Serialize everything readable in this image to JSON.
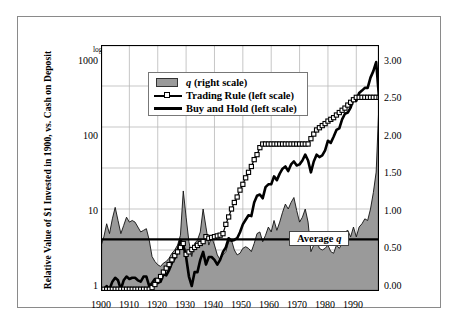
{
  "chart_data": {
    "type": "line",
    "title": "",
    "subtitle": "",
    "ylabel": "Relative Value of $1 Invested in 1900, vs. Cash on Deposit",
    "xlabel": "",
    "y_scale_note": "log scale",
    "yscale": "log",
    "ylim": [
      1,
      1000
    ],
    "yticks": [
      "1",
      "10",
      "100",
      "1000"
    ],
    "y2lim": [
      0.0,
      3.0
    ],
    "y2ticks": [
      "0.00",
      "0.50",
      "1.00",
      "1.50",
      "2.00",
      "2.50",
      "3.00"
    ],
    "xlim": [
      1900,
      1998
    ],
    "xticks": [
      "1900",
      "1910",
      "1920",
      "1930",
      "1940",
      "1950",
      "1960",
      "1970",
      "1980",
      "1990"
    ],
    "grid": true,
    "legend_position": "top-left-inside",
    "legend": [
      {
        "label": "q (right scale)",
        "marker": "filled-area",
        "color": "#9a9a9a",
        "italic_token": "q"
      },
      {
        "label": "Trading Rule (left scale)",
        "marker": "line-open-square",
        "color": "#000000"
      },
      {
        "label": "Buy and Hold (left scale)",
        "marker": "thick-line",
        "color": "#000000"
      }
    ],
    "annotations": [
      {
        "text": "Average q",
        "kind": "horizontal-reference-line",
        "y2_value": 0.63,
        "italic_token": "q"
      }
    ],
    "series": [
      {
        "name": "q (right scale)",
        "axis": "right",
        "type": "area",
        "color": "#9a9a9a",
        "x": [
          1900,
          1901,
          1902,
          1903,
          1904,
          1905,
          1906,
          1907,
          1908,
          1909,
          1910,
          1911,
          1912,
          1913,
          1914,
          1915,
          1916,
          1917,
          1918,
          1919,
          1920,
          1921,
          1922,
          1923,
          1924,
          1925,
          1926,
          1927,
          1928,
          1929,
          1930,
          1931,
          1932,
          1933,
          1934,
          1935,
          1936,
          1937,
          1938,
          1939,
          1940,
          1941,
          1942,
          1943,
          1944,
          1945,
          1946,
          1947,
          1948,
          1949,
          1950,
          1951,
          1952,
          1953,
          1954,
          1955,
          1956,
          1957,
          1958,
          1959,
          1960,
          1961,
          1962,
          1963,
          1964,
          1965,
          1966,
          1967,
          1968,
          1969,
          1970,
          1971,
          1972,
          1973,
          1974,
          1975,
          1976,
          1977,
          1978,
          1979,
          1980,
          1981,
          1982,
          1983,
          1984,
          1985,
          1986,
          1987,
          1988,
          1989,
          1990,
          1991,
          1992,
          1993,
          1994,
          1995,
          1996,
          1997,
          1998
        ],
        "values": [
          0.55,
          0.66,
          0.82,
          0.7,
          0.88,
          1.02,
          0.86,
          0.7,
          0.8,
          0.9,
          0.84,
          0.86,
          0.84,
          0.78,
          0.72,
          0.74,
          0.76,
          0.62,
          0.42,
          0.36,
          0.32,
          0.3,
          0.34,
          0.36,
          0.4,
          0.46,
          0.5,
          0.56,
          0.68,
          1.22,
          0.9,
          0.6,
          0.42,
          0.58,
          0.62,
          0.72,
          1.0,
          0.78,
          0.56,
          0.66,
          0.56,
          0.44,
          0.38,
          0.44,
          0.48,
          0.6,
          0.62,
          0.5,
          0.44,
          0.46,
          0.52,
          0.54,
          0.52,
          0.48,
          0.58,
          0.7,
          0.72,
          0.6,
          0.68,
          0.78,
          0.72,
          0.86,
          0.74,
          0.84,
          0.96,
          1.06,
          1.0,
          1.08,
          1.14,
          0.98,
          0.84,
          0.9,
          1.0,
          0.84,
          0.48,
          0.56,
          0.62,
          0.52,
          0.5,
          0.52,
          0.56,
          0.48,
          0.46,
          0.56,
          0.52,
          0.58,
          0.72,
          0.74,
          0.66,
          0.78,
          0.66,
          0.78,
          0.82,
          0.88,
          0.86,
          1.0,
          1.2,
          1.45,
          2.3
        ]
      },
      {
        "name": "Trading Rule (left scale)",
        "axis": "left",
        "type": "line-marker",
        "color": "#000000",
        "x": [
          1900,
          1901,
          1902,
          1903,
          1904,
          1905,
          1906,
          1907,
          1908,
          1909,
          1910,
          1911,
          1912,
          1913,
          1914,
          1915,
          1916,
          1917,
          1918,
          1919,
          1920,
          1921,
          1922,
          1923,
          1924,
          1925,
          1926,
          1927,
          1928,
          1929,
          1930,
          1931,
          1932,
          1933,
          1934,
          1935,
          1936,
          1937,
          1938,
          1939,
          1940,
          1941,
          1942,
          1943,
          1944,
          1945,
          1946,
          1947,
          1948,
          1949,
          1950,
          1951,
          1952,
          1953,
          1954,
          1955,
          1956,
          1957,
          1958,
          1959,
          1960,
          1961,
          1962,
          1963,
          1964,
          1965,
          1966,
          1967,
          1968,
          1969,
          1970,
          1971,
          1972,
          1973,
          1974,
          1975,
          1976,
          1977,
          1978,
          1979,
          1980,
          1981,
          1982,
          1983,
          1984,
          1985,
          1986,
          1987,
          1988,
          1989,
          1990,
          1991,
          1992,
          1993,
          1994,
          1995,
          1996,
          1997,
          1998
        ],
        "values": [
          1.0,
          1.05,
          1.05,
          1.05,
          1.05,
          1.05,
          1.05,
          1.05,
          1.05,
          1.05,
          1.05,
          1.05,
          1.05,
          1.05,
          1.05,
          1.05,
          1.05,
          1.05,
          1.1,
          1.2,
          1.35,
          1.5,
          1.7,
          1.9,
          2.1,
          2.4,
          2.7,
          3.0,
          3.4,
          3.8,
          2.8,
          3.0,
          3.2,
          3.4,
          3.6,
          3.8,
          4.0,
          4.6,
          4.4,
          4.5,
          4.6,
          4.7,
          4.8,
          5.0,
          6.5,
          8.0,
          10.0,
          12.0,
          14.0,
          17.0,
          20.0,
          24.0,
          28.0,
          33.0,
          40.0,
          46.0,
          56.0,
          62.0,
          62.0,
          62.0,
          62.0,
          62.0,
          62.0,
          62.0,
          62.0,
          62.0,
          62.0,
          62.0,
          62.0,
          62.0,
          62.0,
          62.0,
          62.0,
          62.0,
          72.0,
          82.0,
          92.0,
          98.0,
          104.0,
          110.0,
          118.0,
          124.0,
          130.0,
          140.0,
          150.0,
          160.0,
          170.0,
          185.0,
          200.0,
          215.0,
          230.0,
          230.0,
          230.0,
          230.0,
          230.0,
          230.0,
          230.0,
          230.0,
          230.0
        ]
      },
      {
        "name": "Buy and Hold (left scale)",
        "axis": "left",
        "type": "thick-line",
        "color": "#000000",
        "x": [
          1900,
          1901,
          1902,
          1903,
          1904,
          1905,
          1906,
          1907,
          1908,
          1909,
          1910,
          1911,
          1912,
          1913,
          1914,
          1915,
          1916,
          1917,
          1918,
          1919,
          1920,
          1921,
          1922,
          1923,
          1924,
          1925,
          1926,
          1927,
          1928,
          1929,
          1930,
          1931,
          1932,
          1933,
          1934,
          1935,
          1936,
          1937,
          1938,
          1939,
          1940,
          1941,
          1942,
          1943,
          1944,
          1945,
          1946,
          1947,
          1948,
          1949,
          1950,
          1951,
          1952,
          1953,
          1954,
          1955,
          1956,
          1957,
          1958,
          1959,
          1960,
          1961,
          1962,
          1963,
          1964,
          1965,
          1966,
          1967,
          1968,
          1969,
          1970,
          1971,
          1972,
          1973,
          1974,
          1975,
          1976,
          1977,
          1978,
          1979,
          1980,
          1981,
          1982,
          1983,
          1984,
          1985,
          1986,
          1987,
          1988,
          1989,
          1990,
          1991,
          1992,
          1993,
          1994,
          1995,
          1996,
          1997,
          1998
        ],
        "values": [
          1.0,
          1.05,
          1.15,
          1.05,
          1.3,
          1.45,
          1.35,
          1.05,
          1.35,
          1.5,
          1.4,
          1.45,
          1.45,
          1.35,
          1.3,
          1.5,
          1.5,
          1.15,
          1.25,
          1.4,
          1.25,
          1.3,
          1.6,
          1.55,
          1.8,
          2.2,
          2.5,
          3.1,
          4.2,
          3.6,
          2.6,
          1.5,
          1.15,
          1.7,
          1.7,
          2.4,
          3.0,
          2.1,
          2.6,
          2.6,
          2.4,
          2.1,
          2.4,
          3.0,
          3.4,
          4.4,
          4.1,
          4.2,
          4.4,
          5.2,
          6.5,
          7.4,
          8.4,
          8.2,
          12.0,
          14.5,
          15.0,
          13.5,
          18.5,
          20.0,
          20.0,
          25.0,
          22.5,
          27.0,
          31.0,
          33.0,
          29.0,
          35.0,
          38.0,
          34.0,
          35.0,
          39.0,
          46.0,
          39.0,
          28.0,
          38.0,
          46.0,
          43.0,
          45.0,
          52.0,
          68.0,
          64.0,
          76.0,
          92.0,
          96.0,
          124.0,
          145.0,
          150.0,
          172.0,
          218.0,
          208.0,
          260.0,
          278.0,
          300.0,
          300.0,
          400.0,
          480.0,
          620.0,
          230.0
        ]
      }
    ]
  }
}
